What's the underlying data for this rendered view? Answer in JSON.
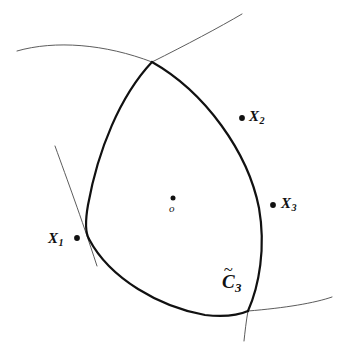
{
  "figure": {
    "background_color": "#ffffff",
    "stroke_color": "#111111",
    "thin_stroke_color": "#4a4a4a",
    "bold_stroke_width": 2.2,
    "thin_stroke_width": 0.9,
    "canvas": {
      "width": 344,
      "height": 356
    }
  },
  "labels": {
    "x1": {
      "base": "X",
      "sub": "1",
      "dot_side": "right"
    },
    "x2": {
      "base": "X",
      "sub": "2",
      "dot_side": "left"
    },
    "x3": {
      "base": "X",
      "sub": "3",
      "dot_side": "left"
    },
    "center": {
      "base": "o",
      "dot_side": "above"
    },
    "region": {
      "base": "C",
      "sub": "3",
      "accent": "~"
    }
  },
  "points": [
    {
      "name": "x1-point",
      "x": 77,
      "y": 238
    },
    {
      "name": "x2-point",
      "x": 242,
      "y": 118
    },
    {
      "name": "x3-point",
      "x": 273,
      "y": 205
    },
    {
      "name": "center-point",
      "x": 173,
      "y": 198
    }
  ],
  "vertices": [
    {
      "name": "top-vertex",
      "x": 152,
      "y": 62
    },
    {
      "name": "bottom-right-vertex",
      "x": 248,
      "y": 311
    },
    {
      "name": "left-crossing",
      "x": 89,
      "y": 239
    }
  ],
  "bold_arcs": [
    {
      "name": "arc-right",
      "d": "M 152 62 C 205 92 248 152 259 208 C 266 248 259 286 248 311"
    },
    {
      "name": "arc-left",
      "d": "M 152 62 C 120 96 98 150 88 205 C 85 222 85 232 89 239"
    },
    {
      "name": "arc-bottom",
      "d": "M 89 239 C 110 279 160 307 205 315 C 224 317 239 315 248 311"
    }
  ],
  "thin_arcs": [
    {
      "name": "thin-arc-upper-left",
      "d": "M 17 51 C 55 40 105 44 152 62"
    },
    {
      "name": "thin-arc-upper-right",
      "d": "M 152 62 C 186 45 220 27 242 14"
    },
    {
      "name": "thin-arc-left-descending",
      "d": "M 55 146 C 68 182 80 214 97 266"
    },
    {
      "name": "thin-arc-bottom-right",
      "d": "M 248 311 C 285 308 315 303 332 297"
    },
    {
      "name": "thin-arc-bottom-descending",
      "d": "M 248 311 C 246 322 245 332 244 341"
    }
  ]
}
